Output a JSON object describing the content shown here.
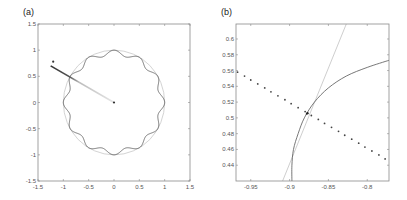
{
  "chart_data": [
    {
      "panel_label": "(a)",
      "type": "line",
      "title": "",
      "xlabel": "",
      "ylabel": "",
      "xlim": [
        -1.5,
        1.5
      ],
      "ylim": [
        -1.5,
        1.5
      ],
      "xticks": [
        -1.5,
        -1,
        -0.5,
        0,
        0.5,
        1,
        1.5
      ],
      "xtick_labels": [
        "-1.5",
        "-1",
        "-0.5",
        "0",
        "0.5",
        "1",
        "1.5"
      ],
      "yticks": [
        -1.5,
        -1,
        -0.5,
        0,
        0.5,
        1,
        1.5
      ],
      "ytick_labels": [
        "-1.5",
        "-1",
        "-0.5",
        "0",
        "0.5",
        "1",
        "1.5"
      ],
      "grid": false,
      "legend": null,
      "series": [
        {
          "name": "unit circle",
          "kind": "circle",
          "center": [
            0,
            0
          ],
          "radius": 1.0,
          "color": "#c8c8c8"
        },
        {
          "name": "perturbed boundary",
          "kind": "wavy-circle",
          "center": [
            0,
            0
          ],
          "radius": 0.95,
          "amplitude": 0.05,
          "lobes": 12,
          "color": "#555555"
        },
        {
          "name": "ray segment",
          "kind": "gradient-line",
          "from": [
            0,
            0
          ],
          "to": [
            -1.25,
            0.7
          ],
          "color_start": "#e6e6e6",
          "color_end": "#333333"
        },
        {
          "name": "marker",
          "kind": "point",
          "x": -1.2,
          "y": 0.78,
          "color": "#333333"
        },
        {
          "name": "center",
          "kind": "point",
          "x": 0,
          "y": 0,
          "color": "#333333"
        }
      ]
    },
    {
      "panel_label": "(b)",
      "type": "line",
      "title": "",
      "xlabel": "",
      "ylabel": "",
      "xlim": [
        -0.969,
        -0.772
      ],
      "ylim": [
        0.42,
        0.619
      ],
      "xticks": [
        -0.95,
        -0.9,
        -0.85,
        -0.8
      ],
      "xtick_labels": [
        "-0.95",
        "-0.9",
        "-0.85",
        "-0.8"
      ],
      "yticks": [
        0.44,
        0.46,
        0.48,
        0.5,
        0.52,
        0.54,
        0.56,
        0.58,
        0.6
      ],
      "ytick_labels": [
        "0.44",
        "0.46",
        "0.48",
        "0.5",
        "0.52",
        "0.54",
        "0.56",
        "0.58",
        "0.6"
      ],
      "grid": false,
      "legend": null,
      "series": [
        {
          "name": "tangent line",
          "kind": "line",
          "points": [
            [
              -0.909,
              0.42
            ],
            [
              -0.827,
              0.619
            ]
          ],
          "color": "#c8c8c8"
        },
        {
          "name": "boundary (zoom)",
          "kind": "curve",
          "points": [
            [
              -0.897,
              0.42
            ],
            [
              -0.897,
              0.44
            ],
            [
              -0.895,
              0.46
            ],
            [
              -0.889,
              0.48
            ],
            [
              -0.881,
              0.5
            ],
            [
              -0.868,
              0.52
            ],
            [
              -0.85,
              0.538
            ],
            [
              -0.827,
              0.553
            ],
            [
              -0.8,
              0.564
            ],
            [
              -0.772,
              0.573
            ]
          ],
          "color": "#555555"
        },
        {
          "name": "sample points",
          "kind": "scatter",
          "x": [
            -0.967,
            -0.958,
            -0.95,
            -0.941,
            -0.932,
            -0.924,
            -0.915,
            -0.906,
            -0.898,
            -0.889,
            -0.88,
            -0.878,
            -0.872,
            -0.863,
            -0.855,
            -0.846,
            -0.837,
            -0.829,
            -0.82,
            -0.811,
            -0.803,
            -0.794,
            -0.785,
            -0.777
          ],
          "y": [
            0.558,
            0.553,
            0.548,
            0.543,
            0.538,
            0.533,
            0.528,
            0.523,
            0.518,
            0.513,
            0.508,
            0.505,
            0.503,
            0.498,
            0.493,
            0.488,
            0.483,
            0.478,
            0.473,
            0.468,
            0.463,
            0.458,
            0.453,
            0.448
          ],
          "color": "#444444"
        },
        {
          "name": "intersection",
          "kind": "point",
          "x": -0.877,
          "y": 0.506,
          "color": "#222222"
        }
      ]
    }
  ]
}
